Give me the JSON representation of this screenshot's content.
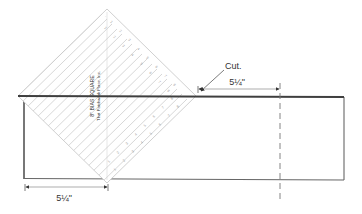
{
  "diagram": {
    "ruler": {
      "title": "8\" BIAS SQUARE",
      "trademark": "®",
      "maker": "That Patchwork Place, Inc.",
      "edge_numbers": [
        "1",
        "2",
        "3",
        "4",
        "5",
        "6",
        "7",
        "8",
        "1",
        "2",
        "3",
        "4",
        "5",
        "6",
        "7",
        "8"
      ]
    },
    "cut_label": "Cut.",
    "top_dimension": "5¼\"",
    "bottom_dimension": "5¼\"",
    "colors": {
      "fabric_outline": "#555555",
      "top_edge": "#444444",
      "ruler_lines": "#b8b8b8",
      "text": "#333333"
    }
  }
}
